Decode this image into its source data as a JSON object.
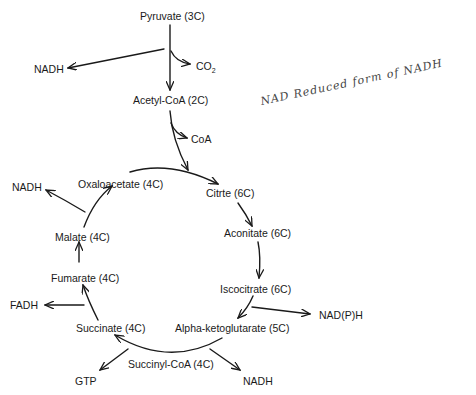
{
  "diagram": {
    "type": "metabolic-cycle",
    "nodes": {
      "pyruvate": "Pyruvate (3C)",
      "acetyl_coa": "Acetyl-CoA (2C)",
      "citrate": "Citrte (6C)",
      "aconitate": "Aconitate (6C)",
      "isocitrate": "Iscocitrate (6C)",
      "alpha_ketoglutarate": "Alpha-ketoglutarate (5C)",
      "succinyl_coa": "Succinyl-CoA (4C)",
      "succinate": "Succinate (4C)",
      "fumarate": "Fumarate (4C)",
      "malate": "Malate (4C)",
      "oxaloacetate": "Oxaloacetate (4C)"
    },
    "byproducts": {
      "nadh_pyruvate": "NADH",
      "co2": "CO",
      "co2_sub": "2",
      "coa": "CoA",
      "nadph_isocitrate": "NAD(P)H",
      "nadh_akg": "NADH",
      "gtp": "GTP",
      "fadh": "FADH",
      "nadh_malate": "NADH"
    },
    "annotation": "NAD Reduced form of NADH",
    "edges": [
      {
        "from": "Pyruvate (3C)",
        "to": "Acetyl-CoA (2C)"
      },
      {
        "from": "Pyruvate (3C)",
        "to": "NADH"
      },
      {
        "from": "Pyruvate (3C)",
        "to": "CO2"
      },
      {
        "from": "Acetyl-CoA (2C)",
        "to": "Citrte (6C)"
      },
      {
        "from": "Acetyl-CoA (2C)",
        "to": "CoA"
      },
      {
        "from": "Oxaloacetate (4C)",
        "to": "Citrte (6C)"
      },
      {
        "from": "Citrte (6C)",
        "to": "Aconitate (6C)"
      },
      {
        "from": "Aconitate (6C)",
        "to": "Iscocitrate (6C)"
      },
      {
        "from": "Iscocitrate (6C)",
        "to": "Alpha-ketoglutarate (5C)"
      },
      {
        "from": "Iscocitrate (6C)",
        "to": "NAD(P)H"
      },
      {
        "from": "Alpha-ketoglutarate (5C)",
        "to": "Succinate (4C)"
      },
      {
        "from": "Alpha-ketoglutarate (5C)",
        "to": "NADH"
      },
      {
        "from": "Succinyl-CoA (4C)",
        "to": "GTP"
      },
      {
        "from": "Succinate (4C)",
        "to": "Fumarate (4C)"
      },
      {
        "from": "Succinate (4C)",
        "to": "FADH"
      },
      {
        "from": "Fumarate (4C)",
        "to": "Malate (4C)"
      },
      {
        "from": "Malate (4C)",
        "to": "Oxaloacetate (4C)"
      },
      {
        "from": "Malate (4C)",
        "to": "NADH"
      }
    ]
  }
}
